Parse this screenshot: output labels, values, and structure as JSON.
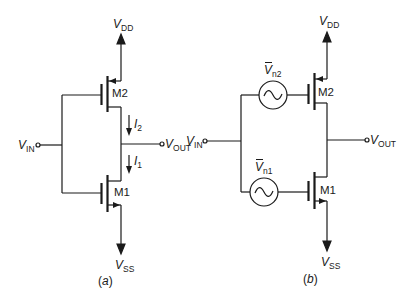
{
  "figure": {
    "panels": [
      {
        "id": "a",
        "caption": "(a)",
        "caption_letter": "a",
        "supply_top": {
          "symbol": "V",
          "sub": "DD"
        },
        "supply_bottom": {
          "symbol": "V",
          "sub": "SS"
        },
        "input": {
          "symbol": "V",
          "sub": "IN"
        },
        "output": {
          "symbol": "V",
          "sub": "OUT"
        },
        "transistors": [
          {
            "name": "M2",
            "type": "PMOS"
          },
          {
            "name": "M1",
            "type": "NMOS"
          }
        ],
        "currents": [
          {
            "symbol": "I",
            "sub": "2"
          },
          {
            "symbol": "I",
            "sub": "1"
          }
        ]
      },
      {
        "id": "b",
        "caption": "(b)",
        "caption_letter": "b",
        "supply_top": {
          "symbol": "V",
          "sub": "DD"
        },
        "supply_bottom": {
          "symbol": "V",
          "sub": "SS"
        },
        "input": {
          "symbol": "V",
          "sub": "IN"
        },
        "output": {
          "symbol": "V",
          "sub": "OUT"
        },
        "transistors": [
          {
            "name": "M2",
            "type": "PMOS"
          },
          {
            "name": "M1",
            "type": "NMOS"
          }
        ],
        "noise_sources": [
          {
            "symbol": "V",
            "sub": "n2"
          },
          {
            "symbol": "V",
            "sub": "n1"
          }
        ]
      }
    ],
    "colors": {
      "line": "#1a1a1a",
      "background": "#ffffff"
    }
  }
}
